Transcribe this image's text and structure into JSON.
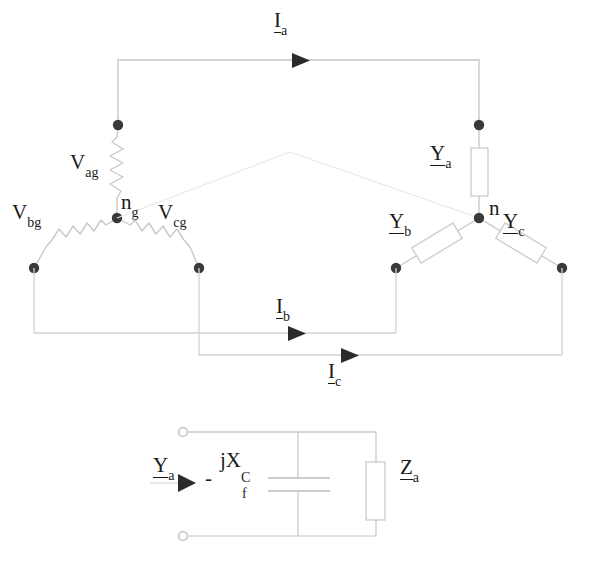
{
  "diagram": {
    "colors": {
      "wire": "#b8b8b8",
      "wire_faint": "#d8d8d8",
      "node": "#3a3a3a",
      "text": "#1a1a1a",
      "component_outline": "#cfcfcf",
      "background": "#ffffff"
    },
    "source_labels": [
      {
        "id": "v-ag",
        "base": "V",
        "sub": "ag",
        "x": 70,
        "y": 157
      },
      {
        "id": "v-bg",
        "base": "V",
        "sub": "bg",
        "x": 12,
        "y": 205
      },
      {
        "id": "v-cg",
        "base": "V",
        "sub": "cg",
        "x": 158,
        "y": 205
      },
      {
        "id": "n-g",
        "base": "n",
        "sub": "g",
        "x": 119,
        "y": 193
      }
    ],
    "load_labels": [
      {
        "id": "y-a",
        "base": "Y",
        "sub": "a",
        "x": 432,
        "y": 145
      },
      {
        "id": "y-b",
        "base": "Y",
        "sub": "b",
        "x": 392,
        "y": 213
      },
      {
        "id": "y-c",
        "base": "Y",
        "sub": "c",
        "x": 505,
        "y": 213
      },
      {
        "id": "n",
        "base": "n",
        "sub": "",
        "x": 489,
        "y": 198
      }
    ],
    "current_labels": [
      {
        "id": "i-a",
        "base": "I",
        "sub": "a",
        "x": 274,
        "y": 10
      },
      {
        "id": "i-b",
        "base": "I",
        "sub": "b",
        "x": 276,
        "y": 296
      },
      {
        "id": "i-c",
        "base": "I",
        "sub": "c",
        "x": 328,
        "y": 361
      }
    ],
    "equivalent_circuit": {
      "admittance_label": {
        "base": "Y",
        "sub": "a",
        "x": 153,
        "y": 461
      },
      "minus_sign": "-",
      "reactance_label": {
        "base": "jX",
        "sub1": "C",
        "sub2": "f",
        "x": 222,
        "y": 452
      },
      "impedance_label": {
        "base": "Z",
        "sub": "a",
        "x": 400,
        "y": 461
      }
    }
  }
}
